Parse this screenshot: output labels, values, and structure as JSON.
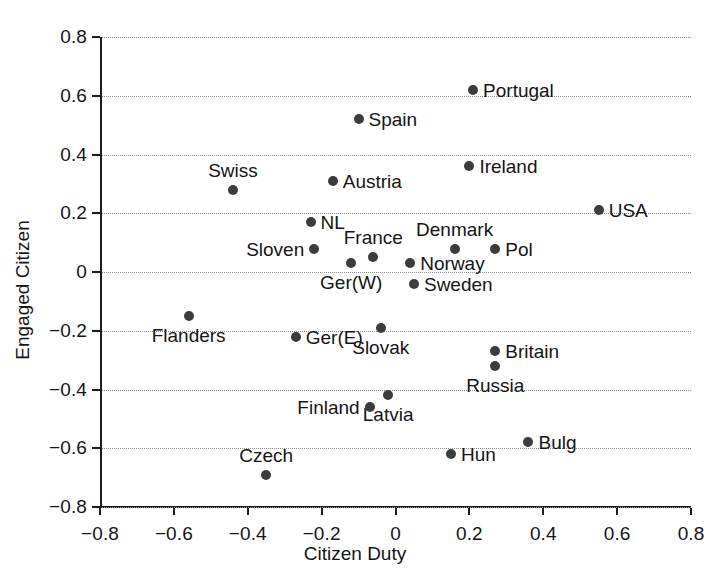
{
  "chart_data": {
    "type": "scatter",
    "title": "",
    "xlabel": "Citizen Duty",
    "ylabel": "Engaged Citizen",
    "xlim": [
      -0.8,
      0.8
    ],
    "ylim": [
      -0.8,
      0.8
    ],
    "grid": true,
    "grid_style": "dotted horizontal",
    "legend": "none",
    "point_color": "#3c3c3c",
    "axis_color": "#1c1c1c",
    "xticks": [
      "-0.8",
      "-0.6",
      "-0.4",
      "-0.2",
      "0",
      "0.2",
      "0.4",
      "0.6",
      "0.8"
    ],
    "xtick_values": [
      -0.8,
      -0.6,
      -0.4,
      -0.2,
      0,
      0.2,
      0.4,
      0.6,
      0.8
    ],
    "yticks": [
      "0.8",
      "0.6",
      "0.4",
      "0.2",
      "0",
      "-0.2",
      "-0.4",
      "-0.6",
      "-0.8"
    ],
    "ytick_values": [
      0.8,
      0.6,
      0.4,
      0.2,
      0,
      -0.2,
      -0.4,
      -0.6,
      -0.8
    ],
    "points": [
      {
        "label": "Portugal",
        "x": 0.21,
        "y": 0.62,
        "label_pos": "right"
      },
      {
        "label": "Spain",
        "x": -0.1,
        "y": 0.52,
        "label_pos": "right"
      },
      {
        "label": "Ireland",
        "x": 0.2,
        "y": 0.36,
        "label_pos": "right"
      },
      {
        "label": "Swiss",
        "x": -0.44,
        "y": 0.28,
        "label_pos": "above"
      },
      {
        "label": "Austria",
        "x": -0.17,
        "y": 0.31,
        "label_pos": "right"
      },
      {
        "label": "USA",
        "x": 0.55,
        "y": 0.21,
        "label_pos": "right"
      },
      {
        "label": "NL",
        "x": -0.23,
        "y": 0.17,
        "label_pos": "right"
      },
      {
        "label": "Denmark",
        "x": 0.16,
        "y": 0.08,
        "label_pos": "above"
      },
      {
        "label": "Pol",
        "x": 0.27,
        "y": 0.08,
        "label_pos": "right"
      },
      {
        "label": "Sloven",
        "x": -0.22,
        "y": 0.08,
        "label_pos": "left"
      },
      {
        "label": "France",
        "x": -0.06,
        "y": 0.05,
        "label_pos": "above"
      },
      {
        "label": "Ger(W)",
        "x": -0.12,
        "y": 0.03,
        "label_pos": "below"
      },
      {
        "label": "Norway",
        "x": 0.04,
        "y": 0.03,
        "label_pos": "right"
      },
      {
        "label": "Sweden",
        "x": 0.05,
        "y": -0.04,
        "label_pos": "right"
      },
      {
        "label": "Flanders",
        "x": -0.56,
        "y": -0.15,
        "label_pos": "below"
      },
      {
        "label": "Ger(E)",
        "x": -0.27,
        "y": -0.22,
        "label_pos": "right"
      },
      {
        "label": "Slovak",
        "x": -0.04,
        "y": -0.19,
        "label_pos": "below"
      },
      {
        "label": "Britain",
        "x": 0.27,
        "y": -0.27,
        "label_pos": "right"
      },
      {
        "label": "Russia",
        "x": 0.27,
        "y": -0.32,
        "label_pos": "below"
      },
      {
        "label": "Latvia",
        "x": -0.02,
        "y": -0.42,
        "label_pos": "below"
      },
      {
        "label": "Finland",
        "x": -0.07,
        "y": -0.46,
        "label_pos": "left"
      },
      {
        "label": "Czech",
        "x": -0.35,
        "y": -0.69,
        "label_pos": "above"
      },
      {
        "label": "Hun",
        "x": 0.15,
        "y": -0.62,
        "label_pos": "right"
      },
      {
        "label": "Bulg",
        "x": 0.36,
        "y": -0.58,
        "label_pos": "right"
      }
    ]
  }
}
